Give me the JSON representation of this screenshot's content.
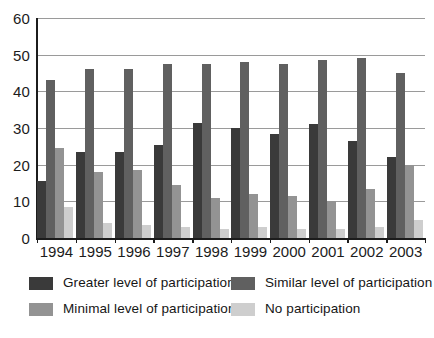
{
  "chart_data": {
    "type": "bar",
    "title": "",
    "xlabel": "",
    "ylabel": "",
    "ylim": [
      0,
      60
    ],
    "ytick_step": 10,
    "yticks": [
      "0",
      "10",
      "20",
      "30",
      "40",
      "50",
      "60"
    ],
    "grid": true,
    "legend_position": "bottom",
    "categories": [
      "1994",
      "1995",
      "1996",
      "1997",
      "1998",
      "1999",
      "2000",
      "2001",
      "2002",
      "2003"
    ],
    "series": [
      {
        "name": "Greater level of participation",
        "color": "#3a3a3a",
        "values": [
          15.5,
          23.5,
          23.5,
          25.5,
          31.5,
          30,
          28.5,
          31,
          26.5,
          22
        ]
      },
      {
        "name": "Similar level of participation",
        "color": "#606060",
        "values": [
          43,
          46,
          46,
          47.5,
          47.5,
          48,
          47.5,
          48.5,
          49,
          45
        ]
      },
      {
        "name": "Minimal level of participation",
        "color": "#939393",
        "values": [
          24.5,
          18,
          18.5,
          14.5,
          11,
          12,
          11.5,
          10,
          13.5,
          20
        ]
      },
      {
        "name": "No participation",
        "color": "#cecece",
        "values": [
          8.5,
          4,
          3.5,
          3,
          2.5,
          3,
          2.5,
          2.5,
          3,
          5
        ]
      }
    ]
  },
  "legend": {
    "items": [
      {
        "label": "Greater level of participation",
        "color": "#3a3a3a"
      },
      {
        "label": "Similar level of participation",
        "color": "#606060"
      },
      {
        "label": "Minimal level of participation",
        "color": "#939393"
      },
      {
        "label": "No participation",
        "color": "#cecece"
      }
    ]
  }
}
